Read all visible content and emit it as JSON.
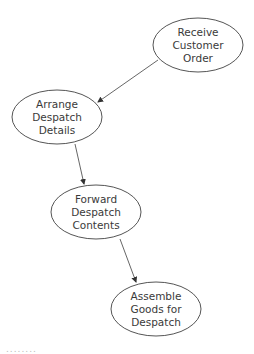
{
  "diagram": {
    "type": "flow-bubble",
    "nodes": [
      {
        "id": "n1",
        "lines": [
          "Receive",
          "Customer",
          "Order"
        ],
        "cx": 198,
        "cy": 45,
        "rx": 45,
        "ry": 27
      },
      {
        "id": "n2",
        "lines": [
          "Arrange",
          "Despatch",
          "Details"
        ],
        "cx": 57,
        "cy": 117,
        "rx": 45,
        "ry": 27
      },
      {
        "id": "n3",
        "lines": [
          "Forward",
          "Despatch",
          "Contents"
        ],
        "cx": 96,
        "cy": 212,
        "rx": 45,
        "ry": 27
      },
      {
        "id": "n4",
        "lines": [
          "Assemble",
          "Goods for",
          "Despatch"
        ],
        "cx": 156,
        "cy": 309,
        "rx": 45,
        "ry": 27
      }
    ],
    "edges": [
      {
        "from": "n1",
        "to": "n2"
      },
      {
        "from": "n2",
        "to": "n3"
      },
      {
        "from": "n3",
        "to": "n4"
      }
    ],
    "footer_fragment": "........"
  }
}
